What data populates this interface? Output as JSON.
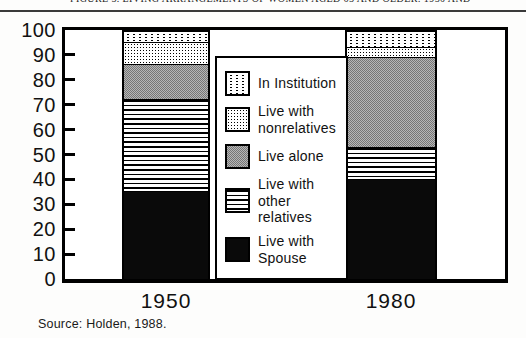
{
  "page": {
    "caption_clipped": "FIGURE 5. LIVING ARRANGEMENTS OF WOMEN AGED 65 AND OLDER: 1950 AND 1980",
    "source": "Source: Holden, 1988."
  },
  "chart_data": {
    "type": "bar",
    "stacked": true,
    "title": "",
    "xlabel": "",
    "ylabel": "",
    "categories": [
      "1950",
      "1980"
    ],
    "series": [
      {
        "name": "Live with Spouse",
        "pattern": "solid-black",
        "values": [
          36,
          41
        ]
      },
      {
        "name": "Live with other relatives",
        "pattern": "h-lines",
        "values": [
          37,
          13
        ]
      },
      {
        "name": "Live alone",
        "pattern": "gray-checker",
        "values": [
          14,
          36
        ]
      },
      {
        "name": "Live with nonrelatives",
        "pattern": "dense-dots",
        "values": [
          9,
          4
        ]
      },
      {
        "name": "In Institution",
        "pattern": "sparse-dots",
        "values": [
          4,
          6
        ]
      }
    ],
    "ylim": [
      0,
      100
    ],
    "yticks": [
      0,
      10,
      20,
      30,
      40,
      50,
      60,
      70,
      80,
      90,
      100
    ],
    "grid": false,
    "legend": {
      "position": "center-overlay",
      "items": [
        {
          "lines": [
            "In Institution"
          ],
          "pattern": "sparse-dots"
        },
        {
          "lines": [
            "Live with",
            "nonrelatives"
          ],
          "pattern": "dense-dots"
        },
        {
          "lines": [
            "Live alone"
          ],
          "pattern": "gray-checker"
        },
        {
          "lines": [
            "Live with other",
            "relatives"
          ],
          "pattern": "h-lines"
        },
        {
          "lines": [
            "Live with",
            "Spouse"
          ],
          "pattern": "solid-black"
        }
      ]
    }
  },
  "colors": {
    "frame": "#000000",
    "solid_black_fill": "#0a0a0a",
    "gray_fill": "#b7b7b7",
    "top_rule": "#3a3a3a",
    "background": "#fdfdfc"
  }
}
